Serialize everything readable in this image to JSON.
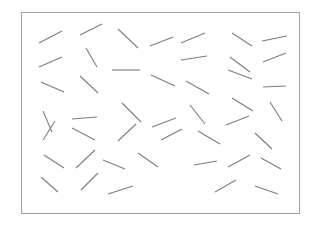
{
  "page": {
    "width": 319,
    "height": 227,
    "background_color": "#ffffff"
  },
  "frame": {
    "name": "stimulus-field-border",
    "x": 21,
    "y": 12,
    "width": 278,
    "height": 201,
    "stroke_color": "#a0a0a0",
    "stroke_width": 1,
    "fill_color": "#ffffff"
  },
  "segments_style": {
    "stroke_color": "#7d7d7d",
    "stroke_width": 1.1,
    "count": 45
  },
  "chart_data": {
    "type": "scatter",
    "title": "",
    "subtitle": "",
    "xlabel": "",
    "ylabel": "",
    "xlim": [
      21,
      299
    ],
    "ylim": [
      12,
      213
    ],
    "grid": false,
    "legend": null,
    "annotations": [],
    "tick_labels": {
      "x": [],
      "y": []
    },
    "series": [
      {
        "name": "line-segments",
        "marker": "line-segment",
        "color": "#7d7d7d",
        "values": [
          {
            "x1": 39,
            "y1": 43,
            "x2": 62,
            "y2": 31
          },
          {
            "x1": 80,
            "y1": 35,
            "x2": 102,
            "y2": 24
          },
          {
            "x1": 118,
            "y1": 29,
            "x2": 138,
            "y2": 48
          },
          {
            "x1": 150,
            "y1": 46,
            "x2": 173,
            "y2": 37
          },
          {
            "x1": 181,
            "y1": 43,
            "x2": 205,
            "y2": 33
          },
          {
            "x1": 232,
            "y1": 33,
            "x2": 252,
            "y2": 46
          },
          {
            "x1": 262,
            "y1": 41,
            "x2": 287,
            "y2": 36
          },
          {
            "x1": 39,
            "y1": 67,
            "x2": 62,
            "y2": 57
          },
          {
            "x1": 86,
            "y1": 48,
            "x2": 97,
            "y2": 67
          },
          {
            "x1": 181,
            "y1": 60,
            "x2": 207,
            "y2": 56
          },
          {
            "x1": 230,
            "y1": 57,
            "x2": 250,
            "y2": 72
          },
          {
            "x1": 263,
            "y1": 62,
            "x2": 286,
            "y2": 53
          },
          {
            "x1": 41,
            "y1": 82,
            "x2": 64,
            "y2": 92
          },
          {
            "x1": 80,
            "y1": 76,
            "x2": 98,
            "y2": 93
          },
          {
            "x1": 112,
            "y1": 70,
            "x2": 140,
            "y2": 70
          },
          {
            "x1": 151,
            "y1": 75,
            "x2": 175,
            "y2": 86
          },
          {
            "x1": 186,
            "y1": 81,
            "x2": 209,
            "y2": 94
          },
          {
            "x1": 228,
            "y1": 70,
            "x2": 252,
            "y2": 79
          },
          {
            "x1": 263,
            "y1": 87,
            "x2": 286,
            "y2": 86
          },
          {
            "x1": 43,
            "y1": 111,
            "x2": 52,
            "y2": 132
          },
          {
            "x1": 72,
            "y1": 119,
            "x2": 97,
            "y2": 117
          },
          {
            "x1": 122,
            "y1": 103,
            "x2": 141,
            "y2": 122
          },
          {
            "x1": 152,
            "y1": 127,
            "x2": 176,
            "y2": 118
          },
          {
            "x1": 190,
            "y1": 105,
            "x2": 205,
            "y2": 124
          },
          {
            "x1": 226,
            "y1": 125,
            "x2": 249,
            "y2": 116
          },
          {
            "x1": 232,
            "y1": 98,
            "x2": 253,
            "y2": 111
          },
          {
            "x1": 270,
            "y1": 102,
            "x2": 282,
            "y2": 121
          },
          {
            "x1": 43,
            "y1": 140,
            "x2": 55,
            "y2": 121
          },
          {
            "x1": 72,
            "y1": 128,
            "x2": 95,
            "y2": 140
          },
          {
            "x1": 118,
            "y1": 141,
            "x2": 136,
            "y2": 124
          },
          {
            "x1": 161,
            "y1": 140,
            "x2": 182,
            "y2": 129
          },
          {
            "x1": 198,
            "y1": 131,
            "x2": 220,
            "y2": 144
          },
          {
            "x1": 255,
            "y1": 133,
            "x2": 272,
            "y2": 149
          },
          {
            "x1": 44,
            "y1": 155,
            "x2": 64,
            "y2": 168
          },
          {
            "x1": 76,
            "y1": 168,
            "x2": 95,
            "y2": 150
          },
          {
            "x1": 103,
            "y1": 160,
            "x2": 125,
            "y2": 169
          },
          {
            "x1": 138,
            "y1": 153,
            "x2": 158,
            "y2": 167
          },
          {
            "x1": 194,
            "y1": 165,
            "x2": 217,
            "y2": 161
          },
          {
            "x1": 228,
            "y1": 167,
            "x2": 250,
            "y2": 155
          },
          {
            "x1": 261,
            "y1": 158,
            "x2": 281,
            "y2": 169
          },
          {
            "x1": 41,
            "y1": 177,
            "x2": 58,
            "y2": 192
          },
          {
            "x1": 81,
            "y1": 190,
            "x2": 98,
            "y2": 173
          },
          {
            "x1": 108,
            "y1": 194,
            "x2": 133,
            "y2": 186
          },
          {
            "x1": 215,
            "y1": 192,
            "x2": 236,
            "y2": 180
          },
          {
            "x1": 255,
            "y1": 186,
            "x2": 278,
            "y2": 194
          }
        ]
      }
    ]
  }
}
